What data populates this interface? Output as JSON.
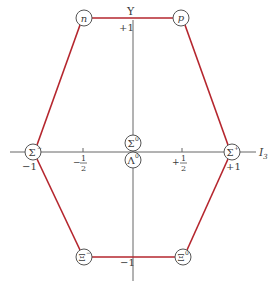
{
  "colors": {
    "hexagon": "#b5262e",
    "axis": "#666666",
    "circle": "#555555",
    "text": "#3a3a3a"
  },
  "axes": {
    "y_label": "Y",
    "x_label": "I",
    "x_label_sub": "3",
    "y_ticks": {
      "top": "+1",
      "bottom": "−1"
    },
    "x_ticks": {
      "left_end": "−1",
      "right_end": "+1",
      "neg_half_sign": "−",
      "pos_half_sign": "+",
      "half_num": "1",
      "half_den": "2"
    }
  },
  "particles": {
    "n": {
      "symbol": "n",
      "sup": "",
      "I3": -0.5,
      "Y": 1
    },
    "p": {
      "symbol": "p",
      "sup": "",
      "I3": 0.5,
      "Y": 1
    },
    "sigma_minus": {
      "symbol": "Σ",
      "sup": "−",
      "I3": -1,
      "Y": 0
    },
    "sigma_plus": {
      "symbol": "Σ",
      "sup": "+",
      "I3": 1,
      "Y": 0
    },
    "sigma_zero": {
      "symbol": "Σ",
      "sup": "0",
      "I3": 0,
      "Y": 0
    },
    "lambda_zero": {
      "symbol": "Λ",
      "sup": "0",
      "I3": 0,
      "Y": 0
    },
    "xi_minus": {
      "symbol": "Ξ",
      "sup": "−",
      "I3": -0.5,
      "Y": -1
    },
    "xi_zero": {
      "symbol": "Ξ",
      "sup": "0",
      "I3": 0.5,
      "Y": -1
    }
  }
}
